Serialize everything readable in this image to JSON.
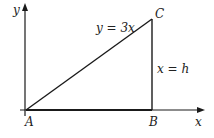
{
  "diagram": {
    "type": "geometry",
    "axes": {
      "x_label": "x",
      "y_label": "y"
    },
    "points": [
      {
        "id": "A",
        "label": "A"
      },
      {
        "id": "B",
        "label": "B"
      },
      {
        "id": "C",
        "label": "C"
      }
    ],
    "lines": {
      "hypotenuse_label": "y = 3x",
      "vertical_label": "x = h"
    },
    "colors": {
      "stroke": "#1a1a1a",
      "background": "#ffffff"
    }
  }
}
